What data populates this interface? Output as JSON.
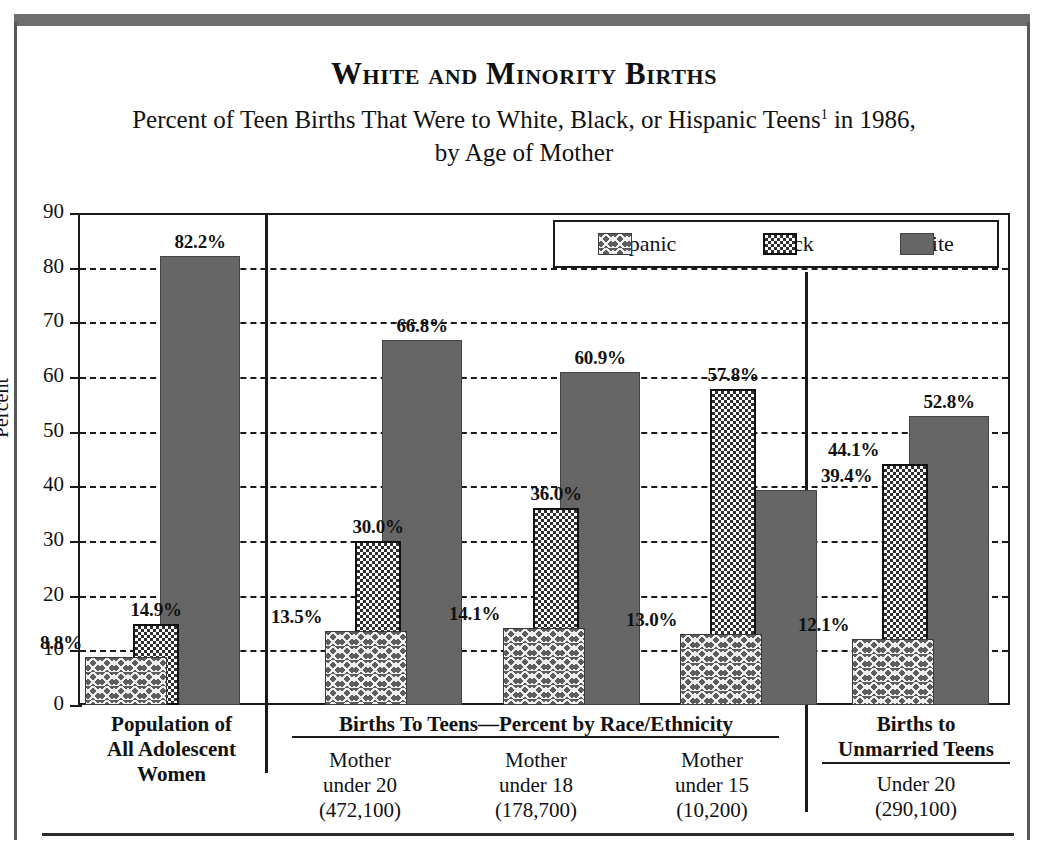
{
  "figure": {
    "title": "White and Minority Births",
    "subtitle_line1_a": "Percent of Teen Births That Were to White, Black, or Hispanic Teens",
    "subtitle_footnote": "1",
    "subtitle_line1_b": " in 1986,",
    "subtitle_line2": "by Age of Mother"
  },
  "legend": {
    "items": [
      {
        "label": "Hispanic",
        "pattern": "crosshatch-weave",
        "color": "#5d5d5d"
      },
      {
        "label": "Black",
        "pattern": "checker-dot",
        "color": "#2f2f2f"
      },
      {
        "label": "White",
        "pattern": "solid",
        "color": "#666666"
      }
    ]
  },
  "axis": {
    "y_title": "Percent",
    "y_ticks": [
      "0",
      "10",
      "20",
      "30",
      "40",
      "50",
      "60",
      "70",
      "80",
      "90"
    ]
  },
  "captions": {
    "panel1_title": "Population of\nAll Adolescent\nWomen",
    "panel1_l1": "Population of",
    "panel1_l2": "All Adolescent",
    "panel1_l3": "Women",
    "panel2_title": "Births To Teens—Percent by Race/Ethnicity",
    "group1_l1": "Mother",
    "group1_l2": "under 20",
    "group1_l3": "(472,100)",
    "group2_l1": "Mother",
    "group2_l2": "under 18",
    "group2_l3": "(178,700)",
    "group3_l1": "Mother",
    "group3_l2": "under 15",
    "group3_l3": "(10,200)",
    "panel3_l1": "Births to",
    "panel3_l2": "Unmarried Teens",
    "panel3_l3": "Under 20",
    "panel3_l4": "(290,100)"
  },
  "chart_data": {
    "type": "bar",
    "title": "White and Minority Births",
    "subtitle": "Percent of Teen Births That Were to White, Black, or Hispanic Teens1 in 1986, by Age of Mother",
    "xlabel": "",
    "ylabel": "Percent",
    "ylim": [
      0,
      90
    ],
    "ytick_step": 10,
    "grid": "horizontal-dashed",
    "legend_position": "top-right-inside",
    "categories": [
      "Population of All Adolescent Women",
      "Mother under 20 (472,100)",
      "Mother under 18 (178,700)",
      "Mother under 15 (10,200)",
      "Under 20 (290,100)"
    ],
    "series": [
      {
        "name": "Hispanic",
        "values": [
          8.8,
          13.5,
          14.1,
          13.0,
          12.1
        ]
      },
      {
        "name": "Black",
        "values": [
          14.9,
          30.0,
          36.0,
          57.8,
          44.1
        ]
      },
      {
        "name": "White",
        "values": [
          82.2,
          66.8,
          60.9,
          39.4,
          52.8
        ]
      }
    ],
    "panels": [
      {
        "name": "Population of All Adolescent Women",
        "groups": [
          "Population of All Adolescent Women"
        ]
      },
      {
        "name": "Births To Teens—Percent by Race/Ethnicity",
        "groups": [
          "Mother under 20 (472,100)",
          "Mother under 18 (178,700)",
          "Mother under 15 (10,200)"
        ]
      },
      {
        "name": "Births to Unmarried Teens",
        "groups": [
          "Under 20 (290,100)"
        ]
      }
    ],
    "data_labels": [
      "8.8%",
      "14.9%",
      "82.2%",
      "13.5%",
      "30.0%",
      "66.8%",
      "14.1%",
      "36.0%",
      "60.9%",
      "13.0%",
      "57.8%",
      "39.4%",
      "12.1%",
      "44.1%",
      "52.8%"
    ]
  },
  "labels": {
    "g0_h": "8.8%",
    "g0_b": "14.9%",
    "g0_w": "82.2%",
    "g1_h": "13.5%",
    "g1_b": "30.0%",
    "g1_w": "66.8%",
    "g2_h": "14.1%",
    "g2_b": "36.0%",
    "g2_w": "60.9%",
    "g3_h": "13.0%",
    "g3_b": "57.8%",
    "g3_w": "39.4%",
    "g4_h": "12.1%",
    "g4_b": "44.1%",
    "g4_w": "52.8%"
  }
}
